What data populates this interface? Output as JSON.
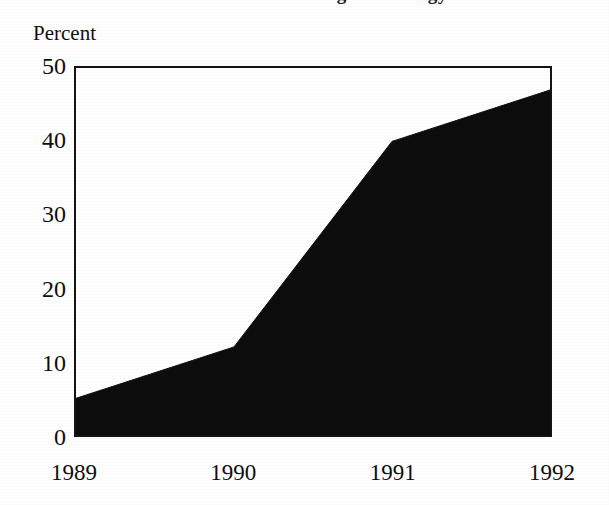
{
  "figure": {
    "title_remnant": "Percent of Sites Using Technology",
    "caption": "Percent",
    "background_color": "#ffffff",
    "frame_color": "#141414",
    "text_color": "#0e0e0e"
  },
  "chart_data": {
    "type": "area",
    "title": "",
    "subtitle": "",
    "xlabel": "",
    "ylabel": "Percent",
    "categories": [
      "1989",
      "1990",
      "1991",
      "1992"
    ],
    "x": [
      1989,
      1990,
      1991,
      1992
    ],
    "values": [
      5,
      12,
      40,
      47
    ],
    "series": [
      {
        "name": "Percent",
        "values": [
          5,
          12,
          40,
          47
        ],
        "fill_color": "#0d0d0d",
        "line_color": "#0d0d0d"
      }
    ],
    "ylim": [
      0,
      50
    ],
    "xlim": [
      1989,
      1992
    ],
    "yticks": [
      "0",
      "10",
      "20",
      "30",
      "40",
      "50"
    ],
    "ytick_values": [
      0,
      10,
      20,
      30,
      40,
      50
    ],
    "xticks": [
      "1989",
      "1990",
      "1991",
      "1992"
    ],
    "grid": false,
    "legend": false,
    "legend_position": "none"
  }
}
